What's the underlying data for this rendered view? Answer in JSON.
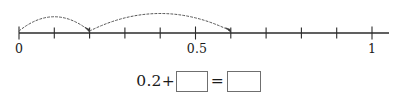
{
  "worksheet": {
    "title": "Number line jump addition"
  },
  "number_line": {
    "min": 0,
    "max": 1,
    "tick_step": 0.1,
    "tick_count": 11,
    "line_color": "#2b2b2b",
    "arc_color": "#555555",
    "labels": [
      {
        "value": 0,
        "text": "0"
      },
      {
        "value": 0.5,
        "text": "0.5"
      },
      {
        "value": 1,
        "text": "1"
      }
    ],
    "jumps": [
      {
        "from": 0,
        "to": 0.2,
        "style": "dashed",
        "arrow": true
      },
      {
        "from": 0.2,
        "to": 0.6,
        "style": "dashed",
        "arrow": true
      }
    ]
  },
  "equation": {
    "first_term": "0.2",
    "plus_sign": "+",
    "equals_sign": "=",
    "addend_box_value": "",
    "sum_box_value": ""
  }
}
